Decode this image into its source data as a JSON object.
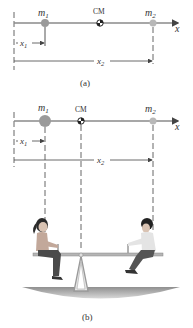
{
  "panel_a": {
    "caption": "(a)",
    "mass1_label": "m",
    "mass1_sub": "1",
    "mass2_label": "m",
    "mass2_sub": "2",
    "cm_label": "CM",
    "axis_label": "x",
    "x1_label": "x",
    "x1_sub": "1",
    "x2_label": "x",
    "x2_sub": "2"
  },
  "panel_b": {
    "caption": "(b)",
    "mass1_label": "m",
    "mass1_sub": "1",
    "mass2_label": "m",
    "mass2_sub": "2",
    "cm_label": "CM",
    "axis_label": "x",
    "x1_label": "x",
    "x1_sub": "1",
    "x2_label": "x",
    "x2_sub": "2",
    "scene": "girl and boy on seesaw balanced at CM"
  },
  "colors": {
    "axis": "#8a8a8a",
    "mass1": "#9a9a9a",
    "mass2": "#b8b8b8",
    "ground": "#9c9c9c",
    "text": "#333333"
  }
}
